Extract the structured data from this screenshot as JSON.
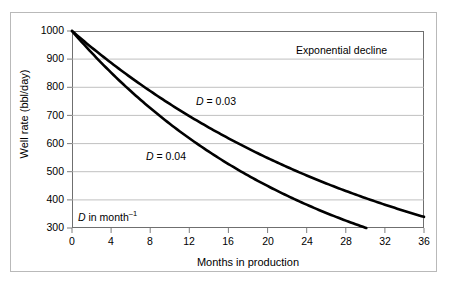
{
  "chart_data": {
    "type": "line",
    "title": "",
    "xlabel": "Months in production",
    "ylabel": "Well rate (bbl/day)",
    "xlim": [
      0,
      36
    ],
    "ylim": [
      300,
      1000
    ],
    "xticks": [
      0,
      4,
      8,
      12,
      16,
      20,
      24,
      28,
      32,
      36
    ],
    "yticks": [
      300,
      400,
      500,
      600,
      700,
      800,
      900,
      1000
    ],
    "grid": "horizontal",
    "legend": "inline-annotations",
    "annotations": [
      {
        "id": "plot-title-note",
        "text": "Exponential decline"
      },
      {
        "id": "curve-1-label",
        "text": "D = 0.03"
      },
      {
        "id": "curve-2-label",
        "text": "D in units"
      },
      {
        "id": "units-note",
        "text": "D in month-1"
      }
    ],
    "x": [
      0,
      2,
      4,
      6,
      8,
      10,
      12,
      14,
      16,
      18,
      20,
      22,
      24,
      26,
      28,
      30,
      32,
      34,
      36
    ],
    "series": [
      {
        "name": "D = 0.03",
        "equation": "q = 1000 * exp(-0.03 * t)",
        "decline_rate": 0.03,
        "initial_rate": 1000,
        "values": [
          1000,
          942,
          887,
          835,
          787,
          741,
          698,
          657,
          619,
          583,
          549,
          517,
          487,
          458,
          431,
          407,
          383,
          361,
          340
        ]
      },
      {
        "name": "D = 0.04",
        "equation": "q = 1000 * exp(-0.04 * t)",
        "decline_rate": 0.04,
        "initial_rate": 1000,
        "values": [
          1000,
          923,
          852,
          787,
          726,
          670,
          619,
          571,
          527,
          487,
          449,
          415,
          383,
          353,
          326,
          301,
          278,
          257,
          237
        ]
      }
    ]
  },
  "axes": {
    "y_title": "Well rate (bbl/day)",
    "x_title": "Months in production",
    "y_tick_labels": [
      "1000",
      "900",
      "800",
      "700",
      "600",
      "500",
      "400",
      "300"
    ],
    "x_tick_labels": [
      "0",
      "4",
      "8",
      "12",
      "16",
      "20",
      "24",
      "28",
      "32",
      "36"
    ]
  },
  "annotations": {
    "regime_note": "Exponential decline",
    "curve_1": {
      "symbol": "D",
      "equals": "= 0.03"
    },
    "curve_2": {
      "symbol": "D",
      "equals": "= 0.04"
    },
    "units": {
      "symbol": "D",
      "text": " in month",
      "exponent": "–1"
    }
  },
  "colors": {
    "curve": "#000000",
    "grid": "#b0b0b0",
    "axis": "#6f6f6f",
    "outer_frame": "#b9b9b9",
    "background": "#ffffff"
  }
}
